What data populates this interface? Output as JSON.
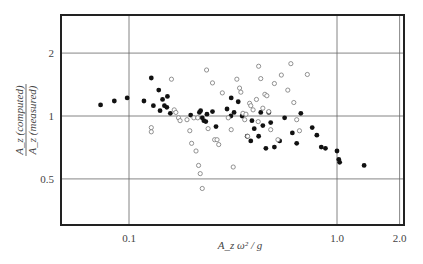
{
  "chart_data": {
    "type": "scatter",
    "title": "",
    "xlabel": "A_z ω² / g",
    "ylabel": "A_z (computed) / A_z (measured)",
    "ylabel_top": "A_z (computed)",
    "ylabel_bottom": "A_z (measured)",
    "xscale": "log",
    "yscale": "log",
    "xlim": [
      0.06,
      2.0
    ],
    "ylim": [
      0.3,
      3.0
    ],
    "x_ticks": [
      {
        "value": 0.1,
        "label": "0.1"
      },
      {
        "value": 1.0,
        "label": "1.0"
      },
      {
        "value": 2.0,
        "label": "2.0"
      }
    ],
    "y_ticks": [
      {
        "value": 0.5,
        "label": "0.5"
      },
      {
        "value": 1,
        "label": "1"
      },
      {
        "value": 2,
        "label": "2"
      }
    ],
    "grid": true,
    "legend": null,
    "series": [
      {
        "name": "filled",
        "marker": "filled-circle",
        "points": [
          [
            0.073,
            1.13
          ],
          [
            0.085,
            1.18
          ],
          [
            0.098,
            1.22
          ],
          [
            0.118,
            1.18
          ],
          [
            0.128,
            1.52
          ],
          [
            0.131,
            1.12
          ],
          [
            0.139,
            1.33
          ],
          [
            0.141,
            1.06
          ],
          [
            0.145,
            1.2
          ],
          [
            0.148,
            1.12
          ],
          [
            0.152,
            1.1
          ],
          [
            0.153,
            1.24
          ],
          [
            0.158,
            1.03
          ],
          [
            0.198,
            1.01
          ],
          [
            0.218,
            1.04
          ],
          [
            0.221,
            1.06
          ],
          [
            0.225,
            0.98
          ],
          [
            0.229,
            0.95
          ],
          [
            0.234,
            0.94
          ],
          [
            0.237,
            1.02
          ],
          [
            0.252,
            1.05
          ],
          [
            0.262,
            0.89
          ],
          [
            0.296,
            1.08
          ],
          [
            0.309,
            1.0
          ],
          [
            0.31,
            1.22
          ],
          [
            0.32,
            1.04
          ],
          [
            0.335,
            1.17
          ],
          [
            0.35,
            1.0
          ],
          [
            0.37,
            0.8
          ],
          [
            0.385,
            0.76
          ],
          [
            0.39,
            0.95
          ],
          [
            0.4,
            0.87
          ],
          [
            0.42,
            0.8
          ],
          [
            0.43,
            1.04
          ],
          [
            0.44,
            0.9
          ],
          [
            0.455,
            0.7
          ],
          [
            0.47,
            1.04
          ],
          [
            0.48,
            0.93
          ],
          [
            0.5,
            0.71
          ],
          [
            0.53,
            0.76
          ],
          [
            0.56,
            0.98
          ],
          [
            0.61,
            0.83
          ],
          [
            0.64,
            0.74
          ],
          [
            0.67,
            1.03
          ],
          [
            0.76,
            0.88
          ],
          [
            0.8,
            0.81
          ],
          [
            0.84,
            0.71
          ],
          [
            0.88,
            0.7
          ],
          [
            1.0,
            0.68
          ],
          [
            1.02,
            0.62
          ],
          [
            1.03,
            0.6
          ],
          [
            1.35,
            0.58
          ]
        ]
      },
      {
        "name": "open",
        "marker": "open-circle",
        "points": [
          [
            0.128,
            0.88
          ],
          [
            0.128,
            0.84
          ],
          [
            0.16,
            1.5
          ],
          [
            0.165,
            1.07
          ],
          [
            0.168,
            1.04
          ],
          [
            0.173,
            0.98
          ],
          [
            0.176,
            0.95
          ],
          [
            0.19,
            0.96
          ],
          [
            0.196,
            0.85
          ],
          [
            0.2,
            0.74
          ],
          [
            0.205,
            0.98
          ],
          [
            0.21,
            0.68
          ],
          [
            0.214,
            0.98
          ],
          [
            0.216,
            0.58
          ],
          [
            0.22,
            0.53
          ],
          [
            0.225,
            0.45
          ],
          [
            0.236,
            1.66
          ],
          [
            0.24,
            0.87
          ],
          [
            0.252,
            1.44
          ],
          [
            0.258,
            0.77
          ],
          [
            0.265,
            0.77
          ],
          [
            0.27,
            0.73
          ],
          [
            0.281,
            1.29
          ],
          [
            0.3,
            0.98
          ],
          [
            0.31,
            0.86
          ],
          [
            0.317,
            0.57
          ],
          [
            0.33,
            1.5
          ],
          [
            0.34,
            1.36
          ],
          [
            0.345,
            1.3
          ],
          [
            0.353,
            1.03
          ],
          [
            0.36,
            0.96
          ],
          [
            0.365,
            1.02
          ],
          [
            0.372,
            0.8
          ],
          [
            0.38,
            1.15
          ],
          [
            0.385,
            1.12
          ],
          [
            0.395,
            1.07
          ],
          [
            0.41,
            1.2
          ],
          [
            0.418,
            0.94
          ],
          [
            0.42,
            1.73
          ],
          [
            0.43,
            1.51
          ],
          [
            0.44,
            1.09
          ],
          [
            0.45,
            1.27
          ],
          [
            0.46,
            1.25
          ],
          [
            0.47,
            1.05
          ],
          [
            0.48,
            0.86
          ],
          [
            0.5,
            1.43
          ],
          [
            0.52,
            0.77
          ],
          [
            0.54,
            1.57
          ],
          [
            0.58,
            1.33
          ],
          [
            0.6,
            1.78
          ],
          [
            0.62,
            1.16
          ],
          [
            0.64,
            0.96
          ],
          [
            0.66,
            0.85
          ],
          [
            0.72,
            1.58
          ]
        ]
      }
    ]
  }
}
